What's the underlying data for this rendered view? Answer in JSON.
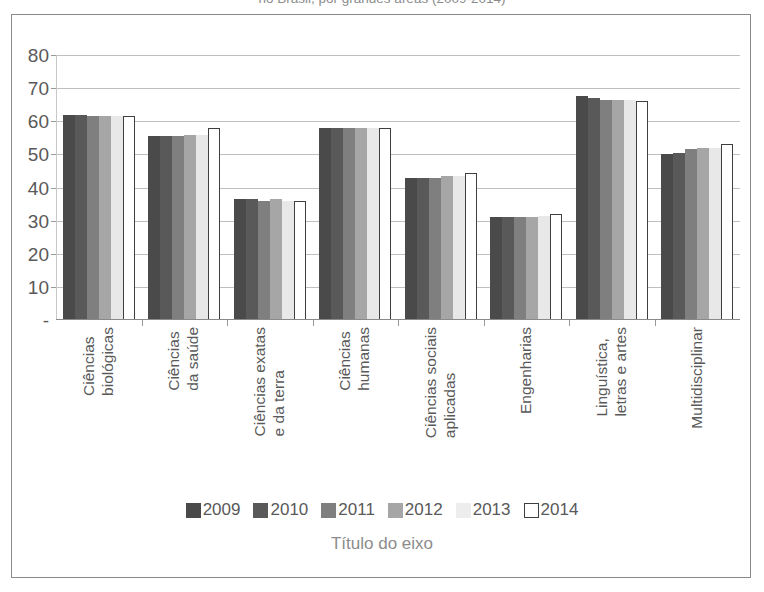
{
  "caption": {
    "text": "no Brasil, por grandes áreas (2009-2014)"
  },
  "chart_data": {
    "type": "bar",
    "title": "",
    "xlabel": "Título do eixo",
    "ylabel": "",
    "ylim": [
      0,
      80
    ],
    "yticks": [
      "-",
      "10",
      "20",
      "30",
      "40",
      "50",
      "60",
      "70",
      "80"
    ],
    "ytick_values": [
      0,
      10,
      20,
      30,
      40,
      50,
      60,
      70,
      80
    ],
    "grid": true,
    "legend_position": "bottom",
    "categories": [
      "Ciências\nbiológicas",
      "Ciências\nda saúde",
      "Ciências exatas\ne da terra",
      "Ciências\nhumanas",
      "Ciências sociais\naplicadas",
      "Engenharias",
      "Linguística,\nletras e artes",
      "Multidisciplinar"
    ],
    "series": [
      {
        "name": "2009",
        "color": "#4a4a4a",
        "values": [
          62.0,
          55.5,
          36.5,
          58.0,
          43.0,
          31.0,
          67.5,
          50.0
        ]
      },
      {
        "name": "2010",
        "color": "#595959",
        "values": [
          62.0,
          55.5,
          36.5,
          58.0,
          43.0,
          31.0,
          67.0,
          50.5
        ]
      },
      {
        "name": "2011",
        "color": "#7f7f7f",
        "values": [
          61.5,
          55.5,
          36.0,
          58.0,
          43.0,
          31.0,
          66.5,
          51.5
        ]
      },
      {
        "name": "2012",
        "color": "#a6a6a6",
        "values": [
          61.5,
          56.0,
          36.5,
          58.0,
          43.5,
          31.0,
          66.5,
          52.0
        ]
      },
      {
        "name": "2013",
        "color": "#e8e8e8",
        "values": [
          61.5,
          56.0,
          36.0,
          58.0,
          43.5,
          31.5,
          66.5,
          52.0
        ]
      },
      {
        "name": "2014",
        "color": "#ffffff",
        "values": [
          61.5,
          58.0,
          36.0,
          58.0,
          44.5,
          32.0,
          66.0,
          53.0
        ]
      }
    ]
  }
}
